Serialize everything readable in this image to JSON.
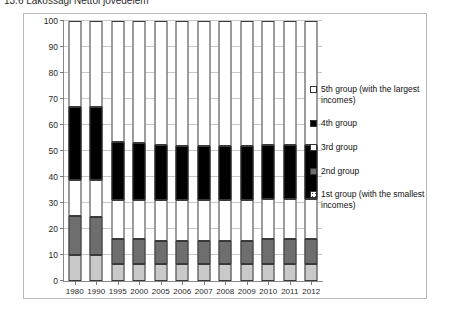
{
  "caption": {
    "text": "13.6   Lakossagi  Nettoi jovedelem"
  },
  "chart_data": {
    "type": "bar",
    "stacked": true,
    "title": "",
    "xlabel": "",
    "ylabel": "",
    "ylim": [
      0,
      100
    ],
    "grid": true,
    "legend_position": "right",
    "categories": [
      "1980",
      "1990",
      "1995",
      "2000",
      "2005",
      "2006",
      "2007",
      "2008",
      "2009",
      "2010",
      "2011",
      "2012"
    ],
    "y_ticks": [
      "0",
      "10",
      "20",
      "30",
      "40",
      "50",
      "60",
      "70",
      "80",
      "90",
      "100"
    ],
    "series": [
      {
        "name": "1st group (with the smallest incomes)",
        "key": "g1",
        "color": "#c9c9c9",
        "values": [
          10,
          10,
          6.5,
          6.5,
          6.5,
          6.5,
          6.5,
          6.5,
          6.5,
          6.5,
          6.5,
          6.5
        ]
      },
      {
        "name": "2nd group",
        "key": "g2",
        "color": "#6e6e6e",
        "values": [
          15,
          14.5,
          9.5,
          9.5,
          9.0,
          9.0,
          9.0,
          9.0,
          9.0,
          9.5,
          9.5,
          9.5
        ]
      },
      {
        "name": "3rd group",
        "key": "g3",
        "color": "#ffffff",
        "values": [
          14,
          14.5,
          15.0,
          15.0,
          15.5,
          15.5,
          15.5,
          15.5,
          15.5,
          15.5,
          15.5,
          15.5
        ]
      },
      {
        "name": "4th group",
        "key": "g4",
        "color": "#000000",
        "values": [
          28,
          28,
          22.5,
          22.0,
          21.5,
          21.0,
          21.0,
          21.0,
          21.0,
          21.0,
          21.0,
          21.0
        ]
      },
      {
        "name": "5th group (with the largest incomes)",
        "key": "g5",
        "color": "#ffffff",
        "values": [
          33,
          33,
          46.5,
          47.0,
          47.5,
          48.0,
          48.0,
          48.0,
          48.0,
          47.5,
          47.5,
          47.5
        ]
      }
    ]
  },
  "legend": {
    "items": [
      {
        "key": "g5",
        "label": "5th group (with the largest incomes)"
      },
      {
        "key": "g4",
        "label": "4th group"
      },
      {
        "key": "g3",
        "label": "3rd group"
      },
      {
        "key": "g2",
        "label": "2nd group"
      },
      {
        "key": "g1",
        "label": "1st group (with the smallest incomes)"
      }
    ]
  }
}
